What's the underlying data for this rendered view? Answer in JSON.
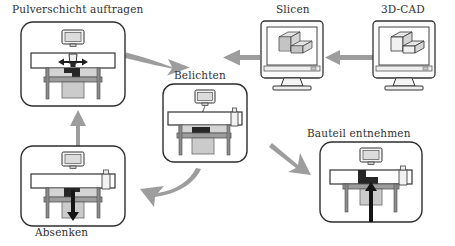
{
  "diagram": {
    "type": "process-cycle-flow-diagram",
    "language": "de",
    "palette": {
      "outline": "#3a3a3a",
      "arrow": "#9a9a9a",
      "panel_border": "#2e2e2e",
      "powder_fill": "#d2d2d2",
      "part_fill": "#2b2b2b",
      "piston_fill": "#b9b9b9",
      "screen_fill": "#e8e8e8",
      "monitor_body": "#f2f2f2",
      "background": "#ffffff",
      "laser_beam": "#8a8a8a"
    },
    "nodes": [
      {
        "id": "powder-deposit",
        "label": "Pulverschicht auftragen",
        "kind": "machine-panel",
        "order": 1,
        "icon_detail": "recoater-arrow-bidirectional",
        "arrow_direction": "horizontal-bidirectional"
      },
      {
        "id": "expose",
        "label": "Belichten",
        "kind": "machine-panel",
        "order": 2,
        "icon_detail": "laser-beam-onto-powder-bed",
        "arrow_direction": "none"
      },
      {
        "id": "lower",
        "label": "Absenken",
        "kind": "machine-panel",
        "order": 3,
        "icon_detail": "build-platform-descending",
        "arrow_direction": "down"
      },
      {
        "id": "remove-part",
        "label": "Bauteil entnehmen",
        "kind": "machine-panel",
        "order": 4,
        "icon_detail": "finished-part-extracted",
        "arrow_direction": "up"
      },
      {
        "id": "slice",
        "label": "Slicen",
        "kind": "monitor",
        "order": 0,
        "icon_detail": "sliced-layered-l-shaped-solid"
      },
      {
        "id": "cad",
        "label": "3D-CAD",
        "kind": "monitor",
        "order": -1,
        "icon_detail": "solid-l-shaped-3d-model"
      }
    ],
    "edges": [
      {
        "from": "cad",
        "to": "slice",
        "style": "straight",
        "direction": "left"
      },
      {
        "from": "slice",
        "to": "powder-deposit",
        "style": "straight",
        "direction": "left"
      },
      {
        "from": "powder-deposit",
        "to": "expose",
        "style": "curved",
        "direction": "right-down"
      },
      {
        "from": "expose",
        "to": "lower",
        "style": "curved",
        "direction": "down-left"
      },
      {
        "from": "lower",
        "to": "powder-deposit",
        "style": "straight",
        "direction": "up"
      },
      {
        "from": "expose",
        "to": "remove-part",
        "style": "straight-diagonal",
        "direction": "down-right"
      }
    ]
  }
}
